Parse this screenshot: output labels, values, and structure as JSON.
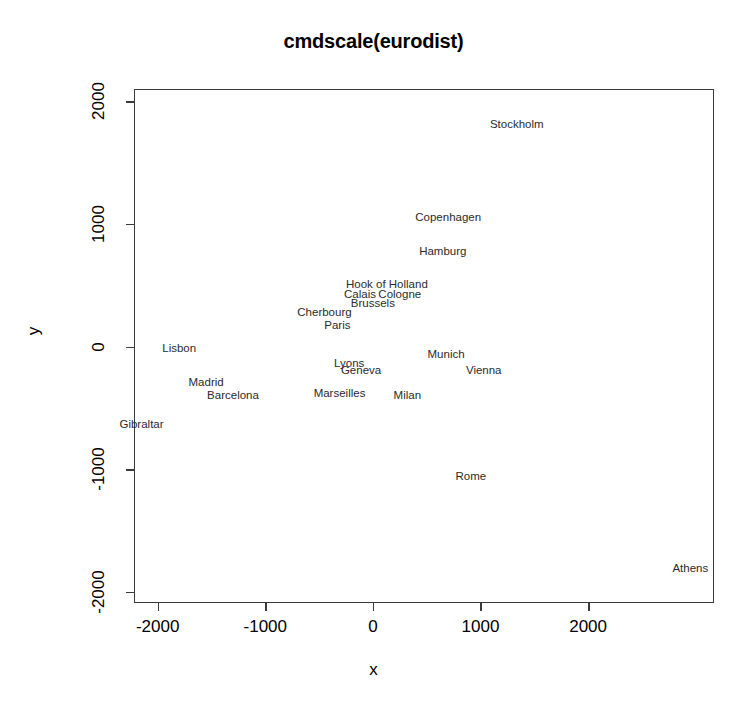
{
  "chart_data": {
    "type": "scatter",
    "title": "cmdscale(eurodist)",
    "xlabel": "x",
    "ylabel": "y",
    "xlim": [
      -2220,
      3170
    ],
    "ylim": [
      -2090,
      2100
    ],
    "xticks": [
      "-2000",
      "-1000",
      "0",
      "1000",
      "2000"
    ],
    "xtick_values": [
      -2000,
      -1000,
      0,
      1000,
      2000
    ],
    "yticks": [
      "2000",
      "1000",
      "0",
      "-1000",
      "-2000"
    ],
    "ytick_values": [
      2000,
      1000,
      0,
      -1000,
      -2000
    ],
    "grid": false,
    "legend": "none",
    "marker": "text-label",
    "points": [
      {
        "label": "Athens",
        "x": 2950,
        "y": -1813
      },
      {
        "label": "Barcelona",
        "x": -1300,
        "y": -400
      },
      {
        "label": "Brussels",
        "x": 0,
        "y": 350
      },
      {
        "label": "Calais",
        "x": -120,
        "y": 420
      },
      {
        "label": "Cherbourg",
        "x": -450,
        "y": 270
      },
      {
        "label": "Cologne",
        "x": 250,
        "y": 420
      },
      {
        "label": "Copenhagen",
        "x": 700,
        "y": 1050
      },
      {
        "label": "Geneva",
        "x": -110,
        "y": -200
      },
      {
        "label": "Gibraltar",
        "x": -2150,
        "y": -640
      },
      {
        "label": "Hamburg",
        "x": 650,
        "y": 770
      },
      {
        "label": "Hook of Holland",
        "x": 130,
        "y": 500
      },
      {
        "label": "Lisbon",
        "x": -1800,
        "y": -20
      },
      {
        "label": "Lyons",
        "x": -220,
        "y": -140
      },
      {
        "label": "Madrid",
        "x": -1550,
        "y": -300
      },
      {
        "label": "Marseilles",
        "x": -310,
        "y": -390
      },
      {
        "label": "Milan",
        "x": 320,
        "y": -400
      },
      {
        "label": "Munich",
        "x": 680,
        "y": -70
      },
      {
        "label": "Paris",
        "x": -330,
        "y": 170
      },
      {
        "label": "Rome",
        "x": 910,
        "y": -1060
      },
      {
        "label": "Stockholm",
        "x": 1337,
        "y": 1807
      },
      {
        "label": "Vienna",
        "x": 1030,
        "y": -200
      }
    ]
  },
  "colors": {
    "background": "#ffffff",
    "axis": "#3a3a3a",
    "label_text": "#2b2b2b",
    "title": "#000000"
  }
}
